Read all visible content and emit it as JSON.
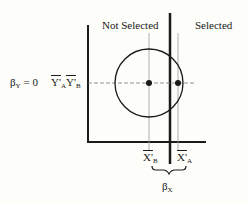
{
  "diagram": {
    "region_labels": {
      "left": "Not Selected",
      "right": "Selected"
    },
    "y_axis_label": {
      "beta": "β",
      "beta_sub": "Y",
      "eq": " = 0"
    },
    "y_means": [
      {
        "sym": "Y'",
        "sub": "A"
      },
      {
        "sym": "Y'",
        "sub": "B"
      }
    ],
    "x_means": [
      {
        "sym": "X'",
        "sub": "B"
      },
      {
        "sym": "X'",
        "sub": "A"
      }
    ],
    "beta_x": {
      "beta": "β",
      "sub": "X"
    },
    "colors": {
      "ink": "#1a1a1a",
      "guide": "#9a9a9a",
      "background": "#fdfdf9"
    }
  }
}
